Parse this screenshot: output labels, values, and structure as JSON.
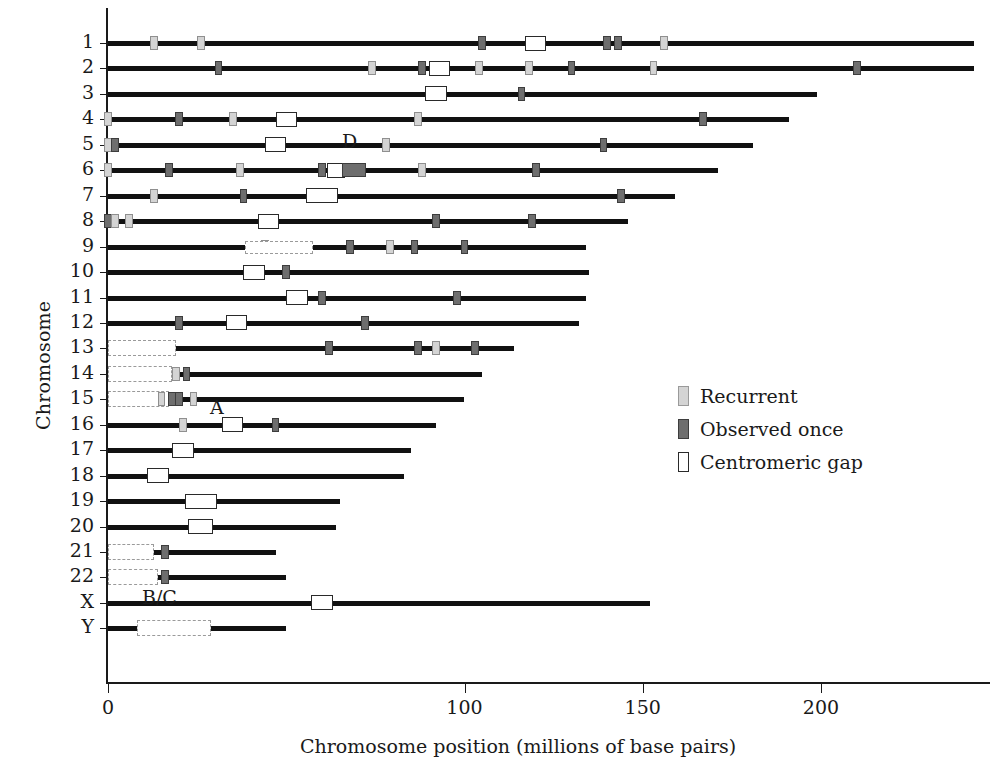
{
  "chart_data": {
    "type": "table",
    "title": "",
    "xlabel": "Chromosome position (millions of base pairs)",
    "ylabel": "Chromosome",
    "xlim": [
      0,
      235
    ],
    "ylim": [
      0,
      25
    ],
    "grid": false,
    "xticks": [
      0,
      100,
      150,
      200
    ],
    "xtick_labels": [
      "0",
      "100",
      "150",
      "200"
    ],
    "legend_position": "right-middle",
    "legend": [
      {
        "key": "recurrent",
        "label": "Recurrent",
        "color": "#d4d4d4"
      },
      {
        "key": "once",
        "label": "Observed once",
        "color": "#6e6e6e"
      },
      {
        "key": "centromere",
        "label": "Centromeric gap",
        "color": "#ffffff"
      }
    ],
    "annotations": [
      {
        "text": "D",
        "x": 68,
        "chrom_between": "4-5"
      },
      {
        "text": "A",
        "x": 19,
        "chrom_between": "14-15"
      },
      {
        "text": "B/C",
        "x": 11,
        "chrom_between": "21-22"
      }
    ],
    "categories": [
      "1",
      "2",
      "3",
      "4",
      "5",
      "6",
      "7",
      "8",
      "9",
      "10",
      "11",
      "12",
      "13",
      "14",
      "15",
      "16",
      "17",
      "18",
      "19",
      "20",
      "21",
      "22",
      "X",
      "Y"
    ],
    "chromosomes": [
      {
        "name": "1",
        "length": 243,
        "acrocentric": null,
        "markers": [
          {
            "pos": 13,
            "type": "recurrent"
          },
          {
            "pos": 26,
            "type": "recurrent"
          },
          {
            "pos": 105,
            "type": "once"
          },
          {
            "pos": 120,
            "type": "centromere",
            "width": 6
          },
          {
            "pos": 140,
            "type": "once"
          },
          {
            "pos": 143,
            "type": "once"
          },
          {
            "pos": 156,
            "type": "recurrent"
          }
        ]
      },
      {
        "name": "2",
        "length": 243,
        "acrocentric": null,
        "markers": [
          {
            "pos": 31,
            "type": "once"
          },
          {
            "pos": 74,
            "type": "recurrent"
          },
          {
            "pos": 88,
            "type": "once"
          },
          {
            "pos": 93,
            "type": "centromere",
            "width": 6
          },
          {
            "pos": 104,
            "type": "recurrent"
          },
          {
            "pos": 118,
            "type": "recurrent"
          },
          {
            "pos": 130,
            "type": "once"
          },
          {
            "pos": 153,
            "type": "recurrent"
          },
          {
            "pos": 210,
            "type": "once"
          }
        ]
      },
      {
        "name": "3",
        "length": 199,
        "acrocentric": null,
        "markers": [
          {
            "pos": 92,
            "type": "centromere",
            "width": 6
          },
          {
            "pos": 116,
            "type": "once"
          }
        ]
      },
      {
        "name": "4",
        "length": 191,
        "acrocentric": null,
        "markers": [
          {
            "pos": 0,
            "type": "recurrent"
          },
          {
            "pos": 20,
            "type": "once"
          },
          {
            "pos": 35,
            "type": "recurrent"
          },
          {
            "pos": 50,
            "type": "centromere",
            "width": 6
          },
          {
            "pos": 87,
            "type": "recurrent"
          },
          {
            "pos": 167,
            "type": "once"
          }
        ]
      },
      {
        "name": "5",
        "length": 181,
        "acrocentric": null,
        "markers": [
          {
            "pos": 0,
            "type": "recurrent"
          },
          {
            "pos": 2,
            "type": "once"
          },
          {
            "pos": 47,
            "type": "centromere",
            "width": 6
          },
          {
            "pos": 78,
            "type": "recurrent"
          },
          {
            "pos": 139,
            "type": "once"
          }
        ]
      },
      {
        "name": "6",
        "length": 171,
        "acrocentric": null,
        "markers": [
          {
            "pos": 0,
            "type": "recurrent"
          },
          {
            "pos": 17,
            "type": "once"
          },
          {
            "pos": 37,
            "type": "recurrent"
          },
          {
            "pos": 60,
            "type": "once"
          },
          {
            "pos": 64,
            "type": "centromere",
            "width": 5
          },
          {
            "pos": 69,
            "type": "once",
            "width": 7
          },
          {
            "pos": 88,
            "type": "recurrent"
          },
          {
            "pos": 120,
            "type": "once"
          }
        ]
      },
      {
        "name": "7",
        "length": 159,
        "acrocentric": null,
        "markers": [
          {
            "pos": 13,
            "type": "recurrent"
          },
          {
            "pos": 38,
            "type": "once"
          },
          {
            "pos": 60,
            "type": "centromere",
            "width": 9
          },
          {
            "pos": 144,
            "type": "once"
          }
        ]
      },
      {
        "name": "8",
        "length": 146,
        "acrocentric": null,
        "markers": [
          {
            "pos": 0,
            "type": "once"
          },
          {
            "pos": 2,
            "type": "recurrent"
          },
          {
            "pos": 6,
            "type": "recurrent"
          },
          {
            "pos": 45,
            "type": "centromere",
            "width": 6
          },
          {
            "pos": 92,
            "type": "once"
          },
          {
            "pos": 119,
            "type": "once"
          }
        ]
      },
      {
        "name": "9",
        "length": 134,
        "acrocentric": null,
        "markers": [
          {
            "pos": 44,
            "type": "recurrent"
          },
          {
            "pos": 48,
            "type": "acro",
            "width": 19
          },
          {
            "pos": 68,
            "type": "once"
          },
          {
            "pos": 79,
            "type": "recurrent"
          },
          {
            "pos": 86,
            "type": "once"
          },
          {
            "pos": 100,
            "type": "once"
          }
        ]
      },
      {
        "name": "10",
        "length": 135,
        "acrocentric": null,
        "markers": [
          {
            "pos": 41,
            "type": "centromere",
            "width": 6
          },
          {
            "pos": 50,
            "type": "once"
          }
        ]
      },
      {
        "name": "11",
        "length": 134,
        "acrocentric": null,
        "markers": [
          {
            "pos": 53,
            "type": "centromere",
            "width": 6
          },
          {
            "pos": 60,
            "type": "once"
          },
          {
            "pos": 98,
            "type": "once"
          }
        ]
      },
      {
        "name": "12",
        "length": 132,
        "acrocentric": null,
        "markers": [
          {
            "pos": 20,
            "type": "once"
          },
          {
            "pos": 36,
            "type": "centromere",
            "width": 6
          },
          {
            "pos": 72,
            "type": "once"
          }
        ]
      },
      {
        "name": "13",
        "length": 114,
        "acrocentric": {
          "start": 0,
          "end": 19
        },
        "markers": [
          {
            "pos": 62,
            "type": "once"
          },
          {
            "pos": 87,
            "type": "once"
          },
          {
            "pos": 92,
            "type": "recurrent"
          },
          {
            "pos": 103,
            "type": "once"
          }
        ]
      },
      {
        "name": "14",
        "length": 105,
        "acrocentric": {
          "start": 0,
          "end": 18
        },
        "markers": [
          {
            "pos": 19,
            "type": "recurrent"
          },
          {
            "pos": 22,
            "type": "once"
          }
        ]
      },
      {
        "name": "15",
        "length": 100,
        "acrocentric": {
          "start": 0,
          "end": 17
        },
        "markers": [
          {
            "pos": 15,
            "type": "recurrent"
          },
          {
            "pos": 18,
            "type": "once"
          },
          {
            "pos": 20,
            "type": "once"
          },
          {
            "pos": 24,
            "type": "recurrent"
          }
        ]
      },
      {
        "name": "16",
        "length": 92,
        "acrocentric": null,
        "markers": [
          {
            "pos": 21,
            "type": "recurrent"
          },
          {
            "pos": 35,
            "type": "centromere",
            "width": 6
          },
          {
            "pos": 47,
            "type": "once"
          }
        ]
      },
      {
        "name": "17",
        "length": 85,
        "acrocentric": null,
        "markers": [
          {
            "pos": 21,
            "type": "centromere",
            "width": 6
          }
        ]
      },
      {
        "name": "18",
        "length": 83,
        "acrocentric": null,
        "markers": [
          {
            "pos": 14,
            "type": "centromere",
            "width": 6
          }
        ]
      },
      {
        "name": "19",
        "length": 65,
        "acrocentric": null,
        "markers": [
          {
            "pos": 26,
            "type": "centromere",
            "width": 9
          }
        ]
      },
      {
        "name": "20",
        "length": 64,
        "acrocentric": null,
        "markers": [
          {
            "pos": 26,
            "type": "centromere",
            "width": 7
          }
        ]
      },
      {
        "name": "21",
        "length": 47,
        "acrocentric": {
          "start": 0,
          "end": 13
        },
        "markers": [
          {
            "pos": 16,
            "type": "once"
          }
        ]
      },
      {
        "name": "22",
        "length": 50,
        "acrocentric": {
          "start": 0,
          "end": 14
        },
        "markers": [
          {
            "pos": 16,
            "type": "once"
          }
        ]
      },
      {
        "name": "X",
        "length": 152,
        "acrocentric": null,
        "markers": [
          {
            "pos": 60,
            "type": "centromere",
            "width": 6
          }
        ]
      },
      {
        "name": "Y",
        "length": 50,
        "acrocentric": {
          "start": 8,
          "end": 29
        },
        "markers": []
      }
    ]
  }
}
